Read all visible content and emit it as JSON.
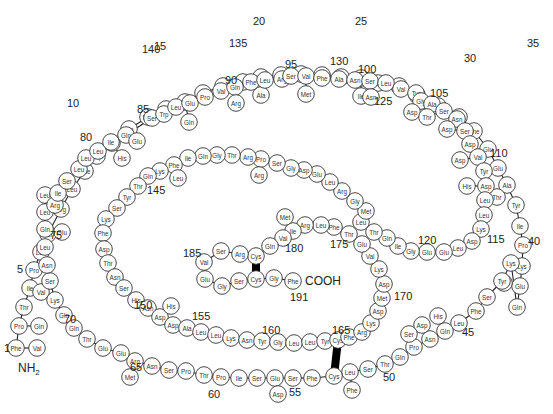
{
  "figure": {
    "n_terminus": "NH2",
    "c_terminus": "COOH",
    "residue_count": 191
  },
  "residues": [
    {
      "n": 1,
      "aa": "Phe",
      "x": 16,
      "y": 348,
      "alt": "Val",
      "ax": 37,
      "ay": 348
    },
    {
      "n": 2,
      "aa": "Pro",
      "x": 19,
      "y": 326,
      "alt": "Gln",
      "ax": 39,
      "ay": 326
    },
    {
      "n": 3,
      "aa": "Thr",
      "x": 24,
      "y": 307
    },
    {
      "n": 4,
      "aa": "Ile",
      "x": 30,
      "y": 288,
      "alt": "Val",
      "ax": 41,
      "ay": 292
    },
    {
      "n": 5,
      "aa": "Pro",
      "x": 34,
      "y": 270
    },
    {
      "n": 6,
      "aa": "Leu",
      "x": 41,
      "y": 252
    },
    {
      "n": 7,
      "aa": "Ser",
      "x": 48,
      "y": 234
    },
    {
      "n": 8,
      "aa": "Arg",
      "x": 61,
      "y": 209
    },
    {
      "n": 9,
      "aa": "Leu",
      "x": 72,
      "y": 189
    },
    {
      "n": 10,
      "aa": "Phe",
      "x": 85,
      "y": 171
    },
    {
      "n": 11,
      "aa": "Asp",
      "x": 97,
      "y": 156
    },
    {
      "n": 12,
      "aa": "Asn",
      "x": 112,
      "y": 143,
      "alt": "His",
      "ax": 122,
      "ay": 158
    },
    {
      "n": 13,
      "aa": "Ala",
      "x": 129,
      "y": 129
    },
    {
      "n": 14,
      "aa": "Met",
      "x": 148,
      "y": 117
    },
    {
      "n": 15,
      "aa": "Leu",
      "x": 166,
      "y": 109
    },
    {
      "n": 16,
      "aa": "Arg",
      "x": 185,
      "y": 102,
      "alt": "Gln",
      "ax": 189,
      "ay": 122
    },
    {
      "n": 17,
      "aa": "Ala",
      "x": 203,
      "y": 93
    },
    {
      "n": 18,
      "aa": "His",
      "x": 223,
      "y": 86
    },
    {
      "n": 19,
      "aa": "Arg",
      "x": 243,
      "y": 82
    },
    {
      "n": 20,
      "aa": "Leu",
      "x": 261,
      "y": 77,
      "alt": "Ala",
      "ax": 261,
      "ay": 95
    },
    {
      "n": 21,
      "aa": "His",
      "x": 281,
      "y": 75
    },
    {
      "n": 22,
      "aa": "Gln",
      "x": 301,
      "y": 74
    },
    {
      "n": 23,
      "aa": "Leu",
      "x": 322,
      "y": 75
    },
    {
      "n": 24,
      "aa": "Ala",
      "x": 341,
      "y": 77
    },
    {
      "n": 25,
      "aa": "Phe",
      "x": 361,
      "y": 78,
      "alt": "Ile",
      "ax": 361,
      "ay": 96
    },
    {
      "n": 26,
      "aa": "Asp",
      "x": 378,
      "y": 83
    },
    {
      "n": 27,
      "aa": "Thr",
      "x": 399,
      "y": 86
    },
    {
      "n": 28,
      "aa": "Tyr",
      "x": 417,
      "y": 95
    },
    {
      "n": 29,
      "aa": "Gln",
      "x": 438,
      "y": 106
    },
    {
      "n": 30,
      "aa": "Glu",
      "x": 459,
      "y": 117
    },
    {
      "n": 31,
      "aa": "Phe",
      "x": 474,
      "y": 131
    },
    {
      "n": 32,
      "aa": "Glu",
      "x": 488,
      "y": 149
    },
    {
      "n": 33,
      "aa": "Glu",
      "x": 498,
      "y": 168
    },
    {
      "n": 34,
      "aa": "Ala",
      "x": 507,
      "y": 185,
      "alt": "Thr",
      "ax": 497,
      "ay": 197
    },
    {
      "n": 35,
      "aa": "Tyr",
      "x": 516,
      "y": 205
    },
    {
      "n": 36,
      "aa": "Ile",
      "x": 520,
      "y": 226
    },
    {
      "n": 37,
      "aa": "Pro",
      "x": 523,
      "y": 245
    },
    {
      "n": 38,
      "aa": "Lys",
      "x": 522,
      "y": 266
    },
    {
      "n": 39,
      "aa": "Glu",
      "x": 520,
      "y": 286,
      "alt": "Asp",
      "ax": 504,
      "ay": 283
    },
    {
      "n": 40,
      "aa": "Gln",
      "x": 517,
      "y": 307
    },
    {
      "n": 41,
      "aa": "Lys",
      "x": 511,
      "y": 263
    },
    {
      "n": 42,
      "aa": "Tyr",
      "x": 502,
      "y": 281
    },
    {
      "n": 43,
      "aa": "Ser",
      "x": 487,
      "y": 297
    },
    {
      "n": 44,
      "aa": "Phe",
      "x": 476,
      "y": 311
    },
    {
      "n": 45,
      "aa": "Leu",
      "x": 459,
      "y": 323
    },
    {
      "n": 46,
      "aa": "Gln",
      "x": 445,
      "y": 331,
      "alt": "His",
      "ax": 438,
      "ay": 316
    },
    {
      "n": 47,
      "aa": "Asn",
      "x": 430,
      "y": 339,
      "alt": "Asp",
      "ax": 422,
      "ay": 325
    },
    {
      "n": 48,
      "aa": "Pro",
      "x": 414,
      "y": 347,
      "alt": "Ser",
      "ax": 409,
      "ay": 334
    },
    {
      "n": 49,
      "aa": "Gln",
      "x": 400,
      "y": 357
    },
    {
      "n": 50,
      "aa": "Thr",
      "x": 385,
      "y": 364
    },
    {
      "n": 51,
      "aa": "Ser",
      "x": 368,
      "y": 369
    },
    {
      "n": 52,
      "aa": "Leu",
      "x": 350,
      "y": 372,
      "alt": "Phe",
      "ax": 352,
      "ay": 390
    },
    {
      "n": 53,
      "aa": "Cys",
      "x": 334,
      "y": 376
    },
    {
      "n": 54,
      "aa": "Phe",
      "x": 312,
      "y": 378
    },
    {
      "n": 55,
      "aa": "Ser",
      "x": 293,
      "y": 378
    },
    {
      "n": 56,
      "aa": "Glu",
      "x": 275,
      "y": 378,
      "alt": "Asp",
      "ax": 278,
      "ay": 394
    },
    {
      "n": 57,
      "aa": "Ser",
      "x": 257,
      "y": 378
    },
    {
      "n": 58,
      "aa": "Ile",
      "x": 239,
      "y": 378
    },
    {
      "n": 59,
      "aa": "Pro",
      "x": 221,
      "y": 377
    },
    {
      "n": 60,
      "aa": "Thr",
      "x": 204,
      "y": 375
    },
    {
      "n": 61,
      "aa": "Pro",
      "x": 186,
      "y": 371
    },
    {
      "n": 62,
      "aa": "Ser",
      "x": 169,
      "y": 370
    },
    {
      "n": 63,
      "aa": "Asn",
      "x": 152,
      "y": 366
    },
    {
      "n": 64,
      "aa": "Arg",
      "x": 135,
      "y": 361,
      "alt": "Met",
      "ax": 130,
      "ay": 377
    },
    {
      "n": 65,
      "aa": "Glu",
      "x": 121,
      "y": 353
    },
    {
      "n": 66,
      "aa": "Glu",
      "x": 103,
      "y": 348
    },
    {
      "n": 67,
      "aa": "Thr",
      "x": 87,
      "y": 339
    },
    {
      "n": 68,
      "aa": "Gln",
      "x": 74,
      "y": 328
    },
    {
      "n": 69,
      "aa": "Gln",
      "x": 64,
      "y": 315
    },
    {
      "n": 70,
      "aa": "Lys",
      "x": 55,
      "y": 300
    },
    {
      "n": 71,
      "aa": "Ser",
      "x": 50,
      "y": 281
    },
    {
      "n": 72,
      "aa": "Asn",
      "x": 47,
      "y": 265
    },
    {
      "n": 73,
      "aa": "Leu",
      "x": 45,
      "y": 247
    },
    {
      "n": 74,
      "aa": "Gln",
      "x": 45,
      "y": 229,
      "alt": "Glu",
      "ax": 62,
      "ay": 232
    },
    {
      "n": 75,
      "aa": "Leu",
      "x": 45,
      "y": 212
    },
    {
      "n": 76,
      "aa": "Leu",
      "x": 45,
      "y": 195
    },
    {
      "n": 77,
      "aa": "Arg",
      "x": 55,
      "y": 205
    },
    {
      "n": 78,
      "aa": "Ile",
      "x": 58,
      "y": 193
    },
    {
      "n": 79,
      "aa": "Ser",
      "x": 67,
      "y": 181
    },
    {
      "n": 80,
      "aa": "Leu",
      "x": 79,
      "y": 169
    },
    {
      "n": 81,
      "aa": "Leu",
      "x": 86,
      "y": 158
    },
    {
      "n": 82,
      "aa": "Leu",
      "x": 98,
      "y": 151
    },
    {
      "n": 83,
      "aa": "Ile",
      "x": 111,
      "y": 142
    },
    {
      "n": 84,
      "aa": "Gln",
      "x": 126,
      "y": 135,
      "alt": "Glu",
      "ax": 137,
      "ay": 141
    },
    {
      "n": 85,
      "aa": "Ser",
      "x": 152,
      "y": 118
    },
    {
      "n": 86,
      "aa": "Trp",
      "x": 164,
      "y": 114
    },
    {
      "n": 87,
      "aa": "Leu",
      "x": 176,
      "y": 107
    },
    {
      "n": 88,
      "aa": "Glu",
      "x": 190,
      "y": 103
    },
    {
      "n": 89,
      "aa": "Pro",
      "x": 205,
      "y": 97
    },
    {
      "n": 90,
      "aa": "Val",
      "x": 221,
      "y": 91
    },
    {
      "n": 91,
      "aa": "Gln",
      "x": 235,
      "y": 87,
      "alt": "Arg",
      "ax": 236,
      "ay": 103
    },
    {
      "n": 92,
      "aa": "Phe",
      "x": 251,
      "y": 82
    },
    {
      "n": 93,
      "aa": "Leu",
      "x": 265,
      "y": 80
    },
    {
      "n": 94,
      "aa": "Arg",
      "x": 282,
      "y": 79
    },
    {
      "n": 95,
      "aa": "Ser",
      "x": 291,
      "y": 76
    },
    {
      "n": 96,
      "aa": "Val",
      "x": 306,
      "y": 76,
      "alt": "Met",
      "ax": 306,
      "ay": 94
    },
    {
      "n": 97,
      "aa": "Phe",
      "x": 322,
      "y": 78
    },
    {
      "n": 98,
      "aa": "Ala",
      "x": 339,
      "y": 79
    },
    {
      "n": 99,
      "aa": "Asn",
      "x": 355,
      "y": 80
    },
    {
      "n": 100,
      "aa": "Ser",
      "x": 370,
      "y": 81,
      "alt": "Asn",
      "ax": 371,
      "ay": 97
    },
    {
      "n": 101,
      "aa": "Leu",
      "x": 386,
      "y": 83
    },
    {
      "n": 102,
      "aa": "Val",
      "x": 401,
      "y": 89
    },
    {
      "n": 103,
      "aa": "Tyr",
      "x": 416,
      "y": 93
    },
    {
      "n": 104,
      "aa": "Gly",
      "x": 421,
      "y": 101,
      "alt": "Asp",
      "ax": 412,
      "ay": 112
    },
    {
      "n": 105,
      "aa": "Ala",
      "x": 432,
      "y": 104,
      "alt": "Thr",
      "ax": 427,
      "ay": 117
    },
    {
      "n": 106,
      "aa": "Ser",
      "x": 444,
      "y": 111
    },
    {
      "n": 107,
      "aa": "Asn",
      "x": 457,
      "y": 119
    },
    {
      "n": 108,
      "aa": "Ser",
      "x": 465,
      "y": 131,
      "alt": "Asp",
      "ax": 447,
      "ay": 129
    },
    {
      "n": 109,
      "aa": "Asp",
      "x": 470,
      "y": 144
    },
    {
      "n": 110,
      "aa": "Val",
      "x": 478,
      "y": 157,
      "alt": "Asp",
      "ax": 460,
      "ay": 160
    },
    {
      "n": 111,
      "aa": "Tyr",
      "x": 484,
      "y": 171
    },
    {
      "n": 112,
      "aa": "Asp",
      "x": 486,
      "y": 186,
      "alt": "His",
      "ax": 467,
      "ay": 186
    },
    {
      "n": 113,
      "aa": "Leu",
      "x": 485,
      "y": 200
    },
    {
      "n": 114,
      "aa": "Leu",
      "x": 484,
      "y": 215
    },
    {
      "n": 115,
      "aa": "Lys",
      "x": 481,
      "y": 229
    },
    {
      "n": 116,
      "aa": "Asp",
      "x": 472,
      "y": 241
    },
    {
      "n": 117,
      "aa": "Leu",
      "x": 458,
      "y": 248
    },
    {
      "n": 118,
      "aa": "Glu",
      "x": 444,
      "y": 252
    },
    {
      "n": 119,
      "aa": "Glu",
      "x": 427,
      "y": 252
    },
    {
      "n": 120,
      "aa": "Gly",
      "x": 411,
      "y": 251
    },
    {
      "n": 121,
      "aa": "Ile",
      "x": 398,
      "y": 246
    },
    {
      "n": 122,
      "aa": "Gln",
      "x": 387,
      "y": 238
    },
    {
      "n": 123,
      "aa": "Thr",
      "x": 374,
      "y": 232
    },
    {
      "n": 124,
      "aa": "Leu",
      "x": 361,
      "y": 222
    },
    {
      "n": 125,
      "aa": "Met",
      "x": 366,
      "y": 211
    },
    {
      "n": 126,
      "aa": "Gly",
      "x": 355,
      "y": 201
    },
    {
      "n": 127,
      "aa": "Arg",
      "x": 342,
      "y": 191
    },
    {
      "n": 128,
      "aa": "Leu",
      "x": 330,
      "y": 182
    },
    {
      "n": 129,
      "aa": "Glu",
      "x": 317,
      "y": 174
    },
    {
      "n": 130,
      "aa": "Asp",
      "x": 304,
      "y": 170
    },
    {
      "n": 131,
      "aa": "Gly",
      "x": 291,
      "y": 168
    },
    {
      "n": 132,
      "aa": "Ser",
      "x": 277,
      "y": 163
    },
    {
      "n": 133,
      "aa": "Pro",
      "x": 261,
      "y": 159,
      "alt": "Arg",
      "ax": 259,
      "ay": 175
    },
    {
      "n": 134,
      "aa": "Arg",
      "x": 248,
      "y": 157
    },
    {
      "n": 135,
      "aa": "Thr",
      "x": 232,
      "y": 155
    },
    {
      "n": 136,
      "aa": "Gly",
      "x": 217,
      "y": 155
    },
    {
      "n": 137,
      "aa": "Gln",
      "x": 203,
      "y": 156
    },
    {
      "n": 138,
      "aa": "Ile",
      "x": 188,
      "y": 158
    },
    {
      "n": 139,
      "aa": "Phe",
      "x": 174,
      "y": 165,
      "alt": "Leu",
      "ax": 178,
      "ay": 178
    },
    {
      "n": 140,
      "aa": "Lys",
      "x": 160,
      "y": 171
    },
    {
      "n": 141,
      "aa": "Gln",
      "x": 148,
      "y": 176
    },
    {
      "n": 142,
      "aa": "Thr",
      "x": 138,
      "y": 186
    },
    {
      "n": 143,
      "aa": "Tyr",
      "x": 127,
      "y": 197
    },
    {
      "n": 144,
      "aa": "Ser",
      "x": 117,
      "y": 208
    },
    {
      "n": 145,
      "aa": "Lys",
      "x": 106,
      "y": 219
    },
    {
      "n": 146,
      "aa": "Phe",
      "x": 103,
      "y": 233
    },
    {
      "n": 147,
      "aa": "Asp",
      "x": 104,
      "y": 249
    },
    {
      "n": 148,
      "aa": "Thr",
      "x": 108,
      "y": 263
    },
    {
      "n": 149,
      "aa": "Asn",
      "x": 115,
      "y": 277
    },
    {
      "n": 150,
      "aa": "Ser",
      "x": 124,
      "y": 288
    },
    {
      "n": 151,
      "aa": "His",
      "x": 136,
      "y": 300
    },
    {
      "n": 152,
      "aa": "Asn",
      "x": 148,
      "y": 308
    },
    {
      "n": 153,
      "aa": "Asp",
      "x": 160,
      "y": 317,
      "alt": "His",
      "ax": 171,
      "ay": 306
    },
    {
      "n": 154,
      "aa": "Asp",
      "x": 173,
      "y": 325
    },
    {
      "n": 155,
      "aa": "Ala",
      "x": 187,
      "y": 328
    },
    {
      "n": 156,
      "aa": "Leu",
      "x": 201,
      "y": 332
    },
    {
      "n": 157,
      "aa": "Leu",
      "x": 216,
      "y": 335
    },
    {
      "n": 158,
      "aa": "Lys",
      "x": 231,
      "y": 338
    },
    {
      "n": 159,
      "aa": "Asn",
      "x": 247,
      "y": 340
    },
    {
      "n": 160,
      "aa": "Tyr",
      "x": 262,
      "y": 341
    },
    {
      "n": 161,
      "aa": "Gly",
      "x": 278,
      "y": 342
    },
    {
      "n": 162,
      "aa": "Leu",
      "x": 294,
      "y": 343
    },
    {
      "n": 163,
      "aa": "Leu",
      "x": 310,
      "y": 342
    },
    {
      "n": 164,
      "aa": "Tyr",
      "x": 325,
      "y": 341
    },
    {
      "n": 165,
      "aa": "Cys",
      "x": 338,
      "y": 340
    },
    {
      "n": 166,
      "aa": "Phe",
      "x": 349,
      "y": 337
    },
    {
      "n": 167,
      "aa": "Arg",
      "x": 362,
      "y": 332
    },
    {
      "n": 168,
      "aa": "Lys",
      "x": 371,
      "y": 323
    },
    {
      "n": 169,
      "aa": "Asp",
      "x": 378,
      "y": 311
    },
    {
      "n": 170,
      "aa": "Met",
      "x": 382,
      "y": 298
    },
    {
      "n": 171,
      "aa": "Asp",
      "x": 384,
      "y": 284
    },
    {
      "n": 172,
      "aa": "Lys",
      "x": 379,
      "y": 269
    },
    {
      "n": 173,
      "aa": "Val",
      "x": 370,
      "y": 256
    },
    {
      "n": 174,
      "aa": "Glu",
      "x": 362,
      "y": 244
    },
    {
      "n": 175,
      "aa": "Thr",
      "x": 349,
      "y": 234
    },
    {
      "n": 176,
      "aa": "Phe",
      "x": 334,
      "y": 227
    },
    {
      "n": 177,
      "aa": "Leu",
      "x": 321,
      "y": 225
    },
    {
      "n": 178,
      "aa": "Arg",
      "x": 305,
      "y": 225
    },
    {
      "n": 179,
      "aa": "Ile",
      "x": 293,
      "y": 231,
      "alt": "Met",
      "ax": 285,
      "ay": 217
    },
    {
      "n": 180,
      "aa": "Val",
      "x": 283,
      "y": 238
    },
    {
      "n": 181,
      "aa": "Gln",
      "x": 270,
      "y": 246
    },
    {
      "n": 182,
      "aa": "Cys",
      "x": 256,
      "y": 256
    },
    {
      "n": 183,
      "aa": "Arg",
      "x": 240,
      "y": 254
    },
    {
      "n": 184,
      "aa": "Ser",
      "x": 221,
      "y": 251
    },
    {
      "n": 185,
      "aa": "Val",
      "x": 204,
      "y": 262
    },
    {
      "n": 186,
      "aa": "Glu",
      "x": 205,
      "y": 279
    },
    {
      "n": 187,
      "aa": "Gly",
      "x": 222,
      "y": 286
    },
    {
      "n": 188,
      "aa": "Ser",
      "x": 239,
      "y": 281
    },
    {
      "n": 189,
      "aa": "Cys",
      "x": 256,
      "y": 279
    },
    {
      "n": 190,
      "aa": "Gly",
      "x": 274,
      "y": 278
    },
    {
      "n": 191,
      "aa": "Phe",
      "x": 293,
      "y": 281
    }
  ],
  "position_labels": [
    {
      "text": "1",
      "x": 4,
      "y": 352
    },
    {
      "text": "5",
      "x": 17,
      "y": 273
    },
    {
      "text": "10",
      "x": 67,
      "y": 107
    },
    {
      "text": "15",
      "x": 154,
      "y": 50
    },
    {
      "text": "20",
      "x": 253,
      "y": 25
    },
    {
      "text": "25",
      "x": 355,
      "y": 25
    },
    {
      "text": "30",
      "x": 464,
      "y": 62
    },
    {
      "text": "35",
      "x": 527,
      "y": 47
    },
    {
      "text": "40",
      "x": 528,
      "y": 245
    },
    {
      "text": "45",
      "x": 462,
      "y": 336
    },
    {
      "text": "50",
      "x": 383,
      "y": 381
    },
    {
      "text": "55",
      "x": 289,
      "y": 396
    },
    {
      "text": "60",
      "x": 208,
      "y": 398
    },
    {
      "text": "65",
      "x": 130,
      "y": 371
    },
    {
      "text": "70",
      "x": 64,
      "y": 323
    },
    {
      "text": "75",
      "x": 50,
      "y": 239
    },
    {
      "text": "80",
      "x": 80,
      "y": 141
    },
    {
      "text": "85",
      "x": 137,
      "y": 113
    },
    {
      "text": "90",
      "x": 225,
      "y": 84
    },
    {
      "text": "95",
      "x": 285,
      "y": 68
    },
    {
      "text": "100",
      "x": 358,
      "y": 73
    },
    {
      "text": "105",
      "x": 430,
      "y": 97
    },
    {
      "text": "110",
      "x": 490,
      "y": 157
    },
    {
      "text": "115",
      "x": 487,
      "y": 243
    },
    {
      "text": "120",
      "x": 418,
      "y": 244
    },
    {
      "text": "125",
      "x": 374,
      "y": 105
    },
    {
      "text": "130",
      "x": 330,
      "y": 65
    },
    {
      "text": "135",
      "x": 229,
      "y": 47
    },
    {
      "text": "140",
      "x": 142,
      "y": 53
    },
    {
      "text": "145",
      "x": 147,
      "y": 194
    },
    {
      "text": "150",
      "x": 134,
      "y": 309
    },
    {
      "text": "155",
      "x": 192,
      "y": 320
    },
    {
      "text": "160",
      "x": 262,
      "y": 334
    },
    {
      "text": "165",
      "x": 332,
      "y": 334
    },
    {
      "text": "170",
      "x": 394,
      "y": 300
    },
    {
      "text": "175",
      "x": 330,
      "y": 248
    },
    {
      "text": "180",
      "x": 285,
      "y": 252
    },
    {
      "text": "185",
      "x": 183,
      "y": 257
    },
    {
      "text": "191",
      "x": 290,
      "y": 301
    }
  ],
  "terminals": {
    "nh2": {
      "text": "NH",
      "sub": "2",
      "x": 18,
      "y": 372
    },
    "cooh": {
      "text": "COOH",
      "x": 305,
      "y": 285
    }
  },
  "disulfide_bonds": [
    {
      "from": 53,
      "to": 165
    },
    {
      "from": 182,
      "to": 189
    }
  ],
  "colors": {
    "circle_stroke": "#333333",
    "circle_fill": "#ffffff",
    "bond": "#222222",
    "disulfide": "#000000",
    "text": "#222222"
  }
}
